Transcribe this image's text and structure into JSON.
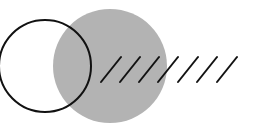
{
  "diagram": {
    "width": 260,
    "height": 133,
    "background": "#ffffff",
    "outline_circle": {
      "cx": 45,
      "cy": 66,
      "r": 46,
      "stroke": "#111111",
      "stroke_width": 2
    },
    "filled_circle": {
      "cx": 110,
      "cy": 66,
      "r": 57,
      "fill": "#b3b3b3"
    },
    "hatch_lines": {
      "stroke": "#111111",
      "stroke_width": 2,
      "lines": [
        {
          "x1": 101,
          "y1": 82,
          "x2": 121,
          "y2": 57
        },
        {
          "x1": 120,
          "y1": 82,
          "x2": 140,
          "y2": 57
        },
        {
          "x1": 139,
          "y1": 82,
          "x2": 159,
          "y2": 57
        },
        {
          "x1": 158,
          "y1": 82,
          "x2": 178,
          "y2": 57
        },
        {
          "x1": 178,
          "y1": 82,
          "x2": 198,
          "y2": 57
        },
        {
          "x1": 197,
          "y1": 82,
          "x2": 217,
          "y2": 57
        },
        {
          "x1": 217,
          "y1": 82,
          "x2": 237,
          "y2": 57
        }
      ]
    }
  }
}
